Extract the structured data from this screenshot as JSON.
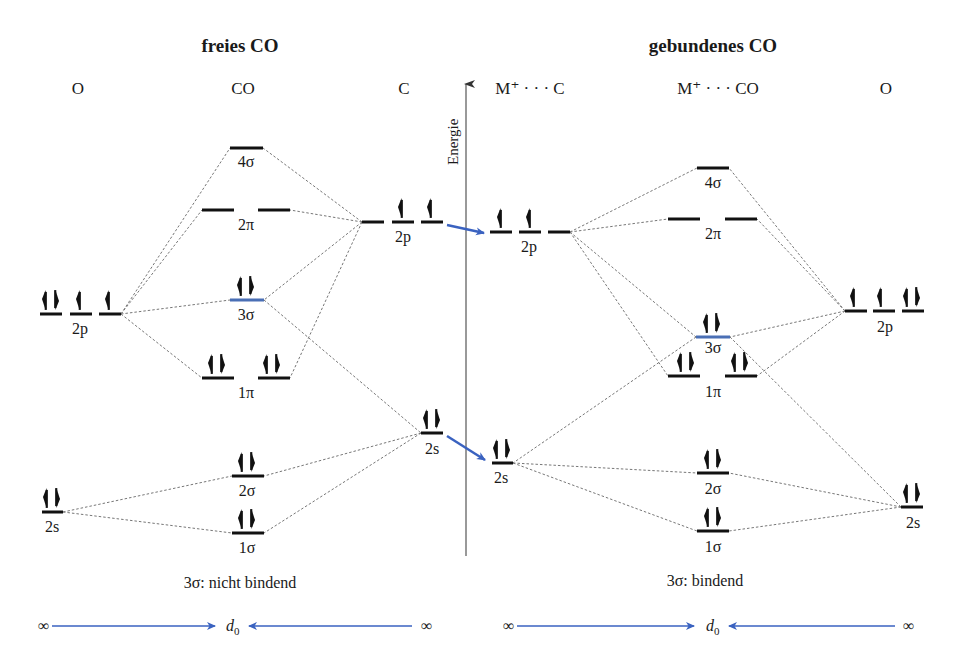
{
  "titles": {
    "left": "freies CO",
    "right": "gebundenes CO"
  },
  "columns": {
    "left_O": "O",
    "left_CO": "CO",
    "left_C": "C",
    "right_MC": "M⁺ · · · C",
    "right_MCO": "M⁺ · · · CO",
    "right_O": "O"
  },
  "axis": {
    "label": "Energie"
  },
  "orbital_labels": {
    "left": {
      "O_2p": "2p",
      "O_2s": "2s",
      "CO_4sigma": "4σ",
      "CO_2pi": "2π",
      "CO_3sigma": "3σ",
      "CO_1pi": "1π",
      "CO_2sigma": "2σ",
      "CO_1sigma": "1σ",
      "C_2p": "2p",
      "C_2s": "2s"
    },
    "right": {
      "C_2p": "2p",
      "C_2s": "2s",
      "CO_4sigma": "4σ",
      "CO_2pi": "2π",
      "CO_3sigma": "3σ",
      "CO_1pi": "1π",
      "CO_2sigma": "2σ",
      "CO_1sigma": "1σ",
      "O_2p": "2p",
      "O_2s": "2s"
    }
  },
  "occupancy": {
    "left": {
      "O_2p": [
        "↑↓",
        "↑",
        "↑"
      ],
      "O_2s": [
        "↑↓"
      ],
      "CO_4sigma": [
        ""
      ],
      "CO_2pi": [
        "",
        ""
      ],
      "CO_3sigma": [
        "↑↓"
      ],
      "CO_1pi": [
        "↑↓",
        "↑↓"
      ],
      "CO_2sigma": [
        "↑↓"
      ],
      "CO_1sigma": [
        "↑↓"
      ],
      "C_2p": [
        "",
        "↑",
        "↑"
      ],
      "C_2s": [
        "↑↓"
      ]
    },
    "right": {
      "C_2p": [
        "↑",
        "↑",
        ""
      ],
      "C_2s": [
        "↑↓"
      ],
      "CO_4sigma": [
        ""
      ],
      "CO_2pi": [
        "",
        ""
      ],
      "CO_3sigma": [
        "↑↓"
      ],
      "CO_1pi": [
        "↑↓",
        "↑↓"
      ],
      "CO_2sigma": [
        "↑↓"
      ],
      "CO_1sigma": [
        "↑↓"
      ],
      "O_2p": [
        "↑",
        "↑",
        "↑↓"
      ],
      "O_2s": [
        "↑↓"
      ]
    }
  },
  "captions": {
    "left": "3σ: nicht bindend",
    "right": "3σ: bindend"
  },
  "distance_scale": {
    "left": {
      "start": "∞",
      "middle_base": "d",
      "middle_sub": "0",
      "end": "∞"
    },
    "right": {
      "start": "∞",
      "middle_base": "d",
      "middle_sub": "0",
      "end": "∞"
    }
  },
  "colors": {
    "highlight_level": "#4a6fb5",
    "arrow": "#3a62c0",
    "level": "#111111",
    "correlation": "#777777"
  }
}
